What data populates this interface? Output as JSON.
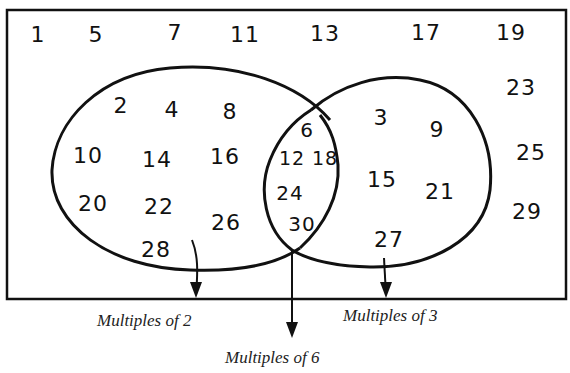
{
  "diagram": {
    "type": "venn",
    "universal_set": {
      "range": "1-30",
      "outside_numbers": [
        {
          "value": "1",
          "x": 38,
          "y": 35
        },
        {
          "value": "5",
          "x": 96,
          "y": 35
        },
        {
          "value": "7",
          "x": 175,
          "y": 33
        },
        {
          "value": "11",
          "x": 245,
          "y": 35
        },
        {
          "value": "13",
          "x": 325,
          "y": 34
        },
        {
          "value": "17",
          "x": 426,
          "y": 33
        },
        {
          "value": "19",
          "x": 511,
          "y": 33
        },
        {
          "value": "23",
          "x": 521,
          "y": 88
        },
        {
          "value": "25",
          "x": 531,
          "y": 153
        },
        {
          "value": "29",
          "x": 527,
          "y": 212
        }
      ]
    },
    "sets": [
      {
        "name": "Multiples of 2",
        "only_numbers": [
          {
            "value": "2",
            "x": 121,
            "y": 106
          },
          {
            "value": "4",
            "x": 172,
            "y": 110
          },
          {
            "value": "8",
            "x": 230,
            "y": 112
          },
          {
            "value": "10",
            "x": 88,
            "y": 156
          },
          {
            "value": "14",
            "x": 157,
            "y": 160
          },
          {
            "value": "16",
            "x": 225,
            "y": 157
          },
          {
            "value": "20",
            "x": 93,
            "y": 204
          },
          {
            "value": "22",
            "x": 159,
            "y": 207
          },
          {
            "value": "26",
            "x": 226,
            "y": 223
          },
          {
            "value": "28",
            "x": 156,
            "y": 250
          }
        ]
      },
      {
        "name": "Multiples of 3",
        "only_numbers": [
          {
            "value": "3",
            "x": 381,
            "y": 118
          },
          {
            "value": "9",
            "x": 437,
            "y": 130
          },
          {
            "value": "15",
            "x": 382,
            "y": 180
          },
          {
            "value": "21",
            "x": 440,
            "y": 192
          },
          {
            "value": "27",
            "x": 389,
            "y": 240
          }
        ]
      }
    ],
    "intersection": {
      "name": "Multiples of 6",
      "numbers": [
        {
          "value": "6",
          "x": 307,
          "y": 130
        },
        {
          "value": "12",
          "x": 292,
          "y": 158
        },
        {
          "value": "18",
          "x": 325,
          "y": 158
        },
        {
          "value": "24",
          "x": 290,
          "y": 193
        },
        {
          "value": "30",
          "x": 302,
          "y": 224
        }
      ]
    },
    "labels": {
      "set_a": "Multiples of 2",
      "set_b": "Multiples of 3",
      "intersection": "Multiples of 6"
    }
  }
}
